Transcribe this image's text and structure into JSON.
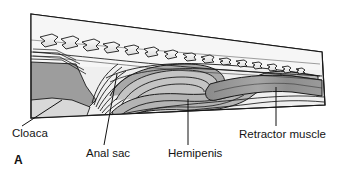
{
  "figure": {
    "panel_letter": "A",
    "caption_labels": [
      {
        "id": "cloaca",
        "text": "Cloaca"
      },
      {
        "id": "anal_sac",
        "text": "Anal sac"
      },
      {
        "id": "hemipenis",
        "text": "Hemipenis"
      },
      {
        "id": "retractor",
        "text": "Retractor muscle"
      }
    ],
    "colors": {
      "background": "#ffffff",
      "outline": "#1a1a1a",
      "body_fill": "#efefef",
      "tissue_light": "#e2e2e2",
      "tissue_mid": "#c9c9c9",
      "tissue_dark": "#9a9a9a",
      "muscle_dark": "#8d8d8d",
      "vertebra_fill": "#f2f2f2",
      "label_text": "#141414"
    },
    "structures": {
      "vertebrae_count": 14,
      "cloaca_position": "left",
      "hemipenis_position": "center",
      "retractor_muscle_position": "right"
    }
  }
}
